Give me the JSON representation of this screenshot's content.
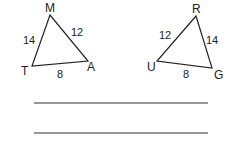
{
  "triangles": [
    {
      "vertices": {
        "top": "M",
        "left": "T",
        "right": "A"
      },
      "sides": {
        "left": "14",
        "right": "12",
        "bottom": "8"
      }
    },
    {
      "vertices": {
        "top": "R",
        "left": "U",
        "right": "G"
      },
      "sides": {
        "left": "12",
        "right": "14",
        "bottom": "8"
      }
    }
  ],
  "answer_lines": 2,
  "colors": {
    "stroke": "#222222",
    "background": "#ffffff"
  }
}
